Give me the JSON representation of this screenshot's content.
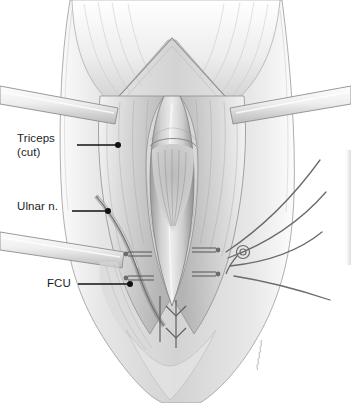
{
  "figure": {
    "kind": "medical-illustration",
    "style": "grayscale pencil rendering",
    "background_color": "#ffffff",
    "ink_color": "#1c1c1c",
    "signature": "artist-signature"
  },
  "labels": [
    {
      "id": "triceps",
      "line1": "Triceps",
      "line2": "(cut)",
      "text": "Triceps\n(cut)"
    },
    {
      "id": "ulnar",
      "line1": "Ulnar n.",
      "line2": "",
      "text": "Ulnar n."
    },
    {
      "id": "fcu",
      "line1": "FCU",
      "line2": "",
      "text": "FCU"
    }
  ],
  "leaders": [
    {
      "id": "triceps-leader",
      "from_x": 77,
      "from_y": 145,
      "to_x": 117,
      "to_y": 145,
      "dot": true
    },
    {
      "id": "ulnar-leader",
      "from_x": 72,
      "from_y": 211,
      "to_x": 108,
      "to_y": 211,
      "dot": true
    },
    {
      "id": "fcu-leader",
      "from_x": 78,
      "from_y": 284,
      "to_x": 130,
      "to_y": 284,
      "dot": true
    }
  ],
  "anatomy": {
    "triceps_flaps": "reflected triceps tendon flaps, left and right",
    "incision": "midline vertical surgical wound",
    "retractors": [
      "upper-left retractor band",
      "upper-right retractor band",
      "lower-left retractor band"
    ],
    "sutures": {
      "knots_left": 2,
      "knots_right": 2,
      "free_strands_right": 4,
      "anchor_loop": true
    },
    "forearm": "distal forearm / olecranon region"
  }
}
